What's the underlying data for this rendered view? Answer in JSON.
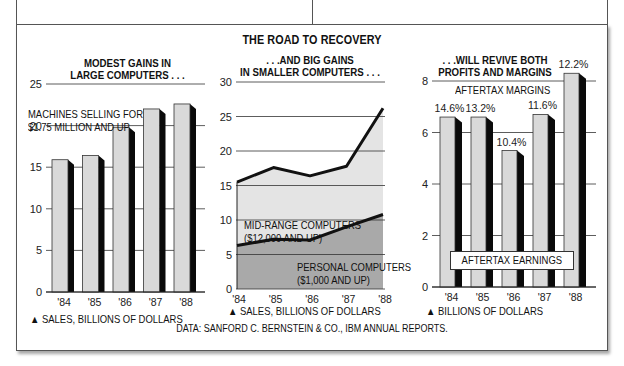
{
  "title": "THE ROAD TO RECOVERY",
  "source": "DATA: SANFORD C. BERNSTEIN & CO., IBM ANNUAL REPORTS.",
  "panels": {
    "left": {
      "subtitle_line1": "MODEST GAINS IN",
      "subtitle_line2": "LARGE COMPUTERS . . .",
      "series_label_line1": "MACHINES SELLING FOR",
      "series_label_line2": "$1.75 MILLION AND UP",
      "axis_note": "▲ SALES, BILLIONS OF DOLLARS"
    },
    "middle": {
      "subtitle_line1": ". . .AND BIG GAINS",
      "subtitle_line2": "IN SMALLER COMPUTERS . . .",
      "midrange_label_line1": "MID-RANGE COMPUTERS",
      "midrange_label_line2": "($12,000 AND UP)",
      "personal_label_line1": "PERSONAL COMPUTERS",
      "personal_label_line2": "($1,000 AND UP)",
      "axis_note": "▲ SALES, BILLIONS OF DOLLARS"
    },
    "right": {
      "subtitle_line1": ". . .WILL REVIVE BOTH",
      "subtitle_line2": "PROFITS AND MARGINS",
      "margins_label": "AFTERTAX MARGINS",
      "earnings_label": "AFTERTAX EARNINGS",
      "axis_note": "▲ BILLIONS OF DOLLARS"
    }
  },
  "colors": {
    "bar_face": "#d9d9d9",
    "bar_shadow": "#0a0a0a",
    "midrange_fill": "#e4e4e4",
    "personal_fill": "#a9a9a9",
    "gridline": "#333333"
  },
  "chart_data": [
    {
      "type": "bar",
      "title": "MODEST GAINS IN LARGE COMPUTERS...",
      "categories": [
        "'84",
        "'85",
        "'86",
        "'87",
        "'88"
      ],
      "series": [
        {
          "name": "Machines selling for $1.75 million and up",
          "values": [
            15.9,
            16.4,
            19.8,
            22.0,
            22.6
          ]
        }
      ],
      "xlabel": "",
      "ylabel": "Sales, billions of dollars",
      "ylim": [
        0,
        25
      ],
      "yticks": [
        0,
        5,
        10,
        15,
        20,
        25
      ],
      "grid": true
    },
    {
      "type": "area",
      "title": "...AND BIG GAINS IN SMALLER COMPUTERS...",
      "categories": [
        "'84",
        "'85",
        "'86",
        "'87",
        "'88"
      ],
      "series": [
        {
          "name": "Personal computers ($1,000 and up)",
          "values": [
            6.3,
            7.2,
            7.1,
            9.0,
            10.8
          ]
        },
        {
          "name": "Mid-range + personal total",
          "values": [
            15.5,
            17.6,
            16.4,
            17.8,
            26.2
          ]
        }
      ],
      "xlabel": "",
      "ylabel": "Sales, billions of dollars",
      "ylim": [
        0,
        30
      ],
      "yticks": [
        0,
        5,
        10,
        15,
        20,
        25,
        30
      ],
      "grid": true,
      "stacked": true
    },
    {
      "type": "bar",
      "title": "...WILL REVIVE BOTH PROFITS AND MARGINS",
      "categories": [
        "'84",
        "'85",
        "'86",
        "'87",
        "'88"
      ],
      "series": [
        {
          "name": "Aftertax earnings",
          "values": [
            6.6,
            6.6,
            5.3,
            6.7,
            8.3
          ]
        }
      ],
      "annotations": {
        "aftertax_margins": [
          "14.6%",
          "13.2%",
          "10.4%",
          "11.6%",
          "12.2%"
        ]
      },
      "xlabel": "",
      "ylabel": "Billions of dollars",
      "ylim": [
        0,
        8
      ],
      "yticks": [
        0,
        2,
        4,
        6,
        8
      ],
      "grid": true
    }
  ]
}
